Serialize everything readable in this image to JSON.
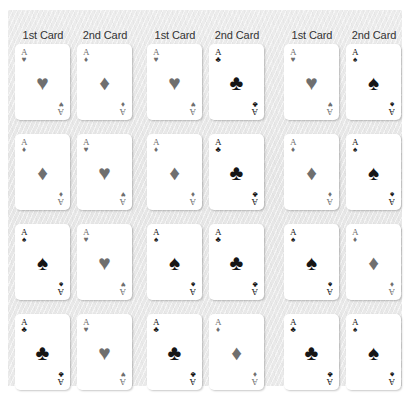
{
  "figure": {
    "caption": "",
    "panel_background": "#e9e9e9",
    "card_face": "#ffffff",
    "black_suit_color": "#161616",
    "red_suit_color": "#6f6f6f"
  },
  "columns": {
    "first_label": "1st Card",
    "second_label": "2nd Card"
  },
  "suit_glyphs": {
    "hearts": "♥",
    "diamonds": "♦",
    "clubs": "♣",
    "spades": "♠"
  },
  "groups": [
    {
      "name": "group-1",
      "headers": [
        "1st Card",
        "2nd Card"
      ],
      "rows": [
        {
          "cards": [
            {
              "rank": "A",
              "suit": "hearts",
              "suit_name": "hearts",
              "color": "red"
            },
            {
              "rank": "A",
              "suit": "diamonds",
              "suit_name": "diamonds",
              "color": "red"
            }
          ]
        },
        {
          "cards": [
            {
              "rank": "A",
              "suit": "diamonds",
              "suit_name": "diamonds",
              "color": "red"
            },
            {
              "rank": "A",
              "suit": "hearts",
              "suit_name": "hearts",
              "color": "red"
            }
          ]
        },
        {
          "cards": [
            {
              "rank": "A",
              "suit": "spades",
              "suit_name": "spades",
              "color": "black"
            },
            {
              "rank": "A",
              "suit": "hearts",
              "suit_name": "hearts",
              "color": "red"
            }
          ]
        },
        {
          "cards": [
            {
              "rank": "A",
              "suit": "clubs",
              "suit_name": "clubs",
              "color": "black"
            },
            {
              "rank": "A",
              "suit": "hearts",
              "suit_name": "hearts",
              "color": "red"
            }
          ]
        }
      ]
    },
    {
      "name": "group-2",
      "headers": [
        "1st Card",
        "2nd Card"
      ],
      "rows": [
        {
          "cards": [
            {
              "rank": "A",
              "suit": "hearts",
              "suit_name": "hearts",
              "color": "red"
            },
            {
              "rank": "A",
              "suit": "clubs",
              "suit_name": "clubs",
              "color": "black"
            }
          ]
        },
        {
          "cards": [
            {
              "rank": "A",
              "suit": "diamonds",
              "suit_name": "diamonds",
              "color": "red"
            },
            {
              "rank": "A",
              "suit": "clubs",
              "suit_name": "clubs",
              "color": "black"
            }
          ]
        },
        {
          "cards": [
            {
              "rank": "A",
              "suit": "spades",
              "suit_name": "spades",
              "color": "black"
            },
            {
              "rank": "A",
              "suit": "clubs",
              "suit_name": "clubs",
              "color": "black"
            }
          ]
        },
        {
          "cards": [
            {
              "rank": "A",
              "suit": "clubs",
              "suit_name": "clubs",
              "color": "black"
            },
            {
              "rank": "A",
              "suit": "diamonds",
              "suit_name": "diamonds",
              "color": "red"
            }
          ]
        }
      ]
    },
    {
      "name": "group-3",
      "headers": [
        "1st Card",
        "2nd Card"
      ],
      "rows": [
        {
          "cards": [
            {
              "rank": "A",
              "suit": "hearts",
              "suit_name": "hearts",
              "color": "red"
            },
            {
              "rank": "A",
              "suit": "spades",
              "suit_name": "spades",
              "color": "black"
            }
          ]
        },
        {
          "cards": [
            {
              "rank": "A",
              "suit": "diamonds",
              "suit_name": "diamonds",
              "color": "red"
            },
            {
              "rank": "A",
              "suit": "spades",
              "suit_name": "spades",
              "color": "black"
            }
          ]
        },
        {
          "cards": [
            {
              "rank": "A",
              "suit": "spades",
              "suit_name": "spades",
              "color": "black"
            },
            {
              "rank": "A",
              "suit": "diamonds",
              "suit_name": "diamonds",
              "color": "red"
            }
          ]
        },
        {
          "cards": [
            {
              "rank": "A",
              "suit": "clubs",
              "suit_name": "clubs",
              "color": "black"
            },
            {
              "rank": "A",
              "suit": "spades",
              "suit_name": "spades",
              "color": "black"
            }
          ]
        }
      ]
    }
  ]
}
